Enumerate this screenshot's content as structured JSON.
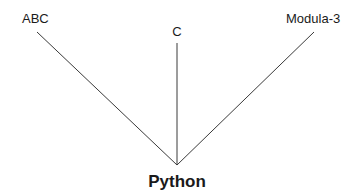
{
  "diagram": {
    "type": "influence-tree",
    "root": "Python",
    "parents": [
      {
        "id": "abc",
        "label": "ABC"
      },
      {
        "id": "c",
        "label": "C"
      },
      {
        "id": "modula3",
        "label": "Modula-3"
      }
    ],
    "edges": [
      {
        "from": "abc",
        "to": "python"
      },
      {
        "from": "c",
        "to": "python"
      },
      {
        "from": "modula3",
        "to": "python"
      }
    ],
    "colors": {
      "line": "#3a3a3a",
      "text": "#1a1a1a"
    }
  }
}
